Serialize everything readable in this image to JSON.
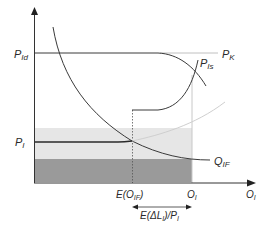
{
  "diagram": {
    "type": "economics-curve-diagram",
    "axes": {
      "y_axis_label": "",
      "x_axis_label": {
        "main": "O",
        "sub": "I"
      }
    },
    "labels": {
      "p_id": {
        "main": "P",
        "sub": "Id"
      },
      "p_k": {
        "main": "P",
        "sub": "K"
      },
      "p_is": {
        "main": "P",
        "sub": "Is"
      },
      "p_i": {
        "main": "P",
        "sub": "I"
      },
      "q_if": {
        "main": "Q",
        "sub": "IF"
      },
      "e_o_if": {
        "prefix": "E(O",
        "sub": "IF",
        "suffix": ")"
      },
      "o_i_tick": {
        "main": "O",
        "sub": "I"
      },
      "e_delta_l": {
        "prefix": "E(ΔL",
        "sub": "I",
        "mid": ")/P",
        "sub2": "I"
      }
    },
    "colors": {
      "axis": "#333333",
      "curve_dark": "#3a3a3a",
      "curve_light": "#c8c8c8",
      "band_light": "#e6e6e6",
      "band_dark": "#9a9a9a",
      "guide_line": "#bfbfbf"
    }
  }
}
